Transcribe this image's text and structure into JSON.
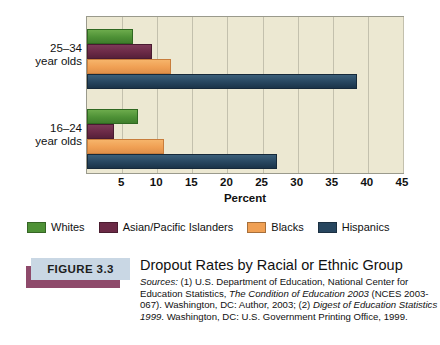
{
  "chart_data": {
    "type": "bar",
    "orientation": "horizontal",
    "title": "Dropout Rates by Racial or Ethnic Group",
    "xlabel": "Percent",
    "ylabel": "",
    "xlim": [
      0,
      45
    ],
    "xticks": [
      5,
      10,
      15,
      20,
      25,
      30,
      35,
      40,
      45
    ],
    "grid": true,
    "legend_position": "bottom-left",
    "categories": [
      "25–34 year olds",
      "16–24 year olds"
    ],
    "category_lines": [
      [
        "25–34",
        "year olds"
      ],
      [
        "16–24",
        "year olds"
      ]
    ],
    "series": [
      {
        "name": "Whites",
        "color": "#4e9136",
        "values": [
          6.5,
          7.3
        ]
      },
      {
        "name": "Asian/Pacific Islanders",
        "color": "#6b2a46",
        "values": [
          9.3,
          3.9
        ]
      },
      {
        "name": "Blacks",
        "color": "#f0a054",
        "values": [
          12.0,
          10.9
        ]
      },
      {
        "name": "Hispanics",
        "color": "#27465f",
        "values": [
          38.5,
          27.0
        ]
      }
    ]
  },
  "figure": {
    "badge_label": "FIGURE 3.3",
    "title": "Dropout Rates by Racial or Ethnic Group",
    "sources_label": "Sources:",
    "sources_lines": [
      "(1) U.S. Department of Education, National Center",
      "for Education Statistics, ",
      "The Condition of Education 2003",
      "(NCES 2003-067). Washington, DC: Author, 2003;",
      "(2) ",
      "Digest of Education Statistics 1999",
      ". Washington, DC: U.S.",
      "Government Printing Office, 1999."
    ]
  },
  "axis": {
    "x_title": "Percent",
    "tick_labels": [
      "5",
      "10",
      "15",
      "20",
      "25",
      "30",
      "35",
      "40",
      "45"
    ]
  },
  "colors": {
    "plot_background": "#ece8d2",
    "gridline": "#c3c0ad",
    "badge_background": "#c9d7e4",
    "badge_shadow": "#8e4a6b"
  }
}
